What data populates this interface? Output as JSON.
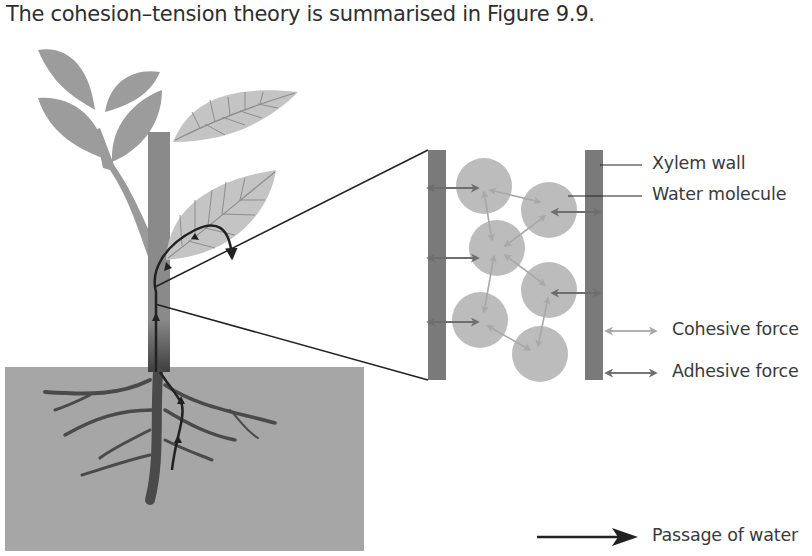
{
  "intro_text": "The cohesion–tension theory is summarised in Figure 9.9.",
  "figure": {
    "labels": {
      "xylem_wall": "Xylem wall",
      "water_molecule": "Water molecule"
    },
    "legend": [
      {
        "key": "cohesive",
        "label": "Cohesive force",
        "color": "#b0b0b0"
      },
      {
        "key": "adhesive",
        "label": "Adhesive force",
        "color": "#777777"
      },
      {
        "key": "water",
        "label": "Passage of water",
        "color": "#222222"
      }
    ],
    "colors": {
      "soil": "#a6a6a6",
      "leaf_dark": "#9c9c9c",
      "leaf_light": "#c4c4c4",
      "stem": "#8a8a8a",
      "root": "#4a4a4a",
      "xylem_wall": "#7a7a7a",
      "molecule": "#bcbcbc",
      "water_arrow": "#222222"
    }
  }
}
